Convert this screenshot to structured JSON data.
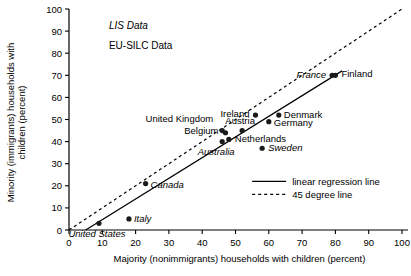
{
  "chart_data": {
    "type": "scatter",
    "title": "",
    "xlabel": "Majority (nonimmigrants) households with children (percent)",
    "ylabel": "Minority (immigrants) households with children (percent)",
    "xlim": [
      0,
      100
    ],
    "ylim": [
      0,
      100
    ],
    "xticks": [
      "0",
      "10",
      "20",
      "30",
      "40",
      "50",
      "60",
      "70",
      "80",
      "90",
      "100"
    ],
    "yticks": [
      "0",
      "10",
      "20",
      "30",
      "40",
      "50",
      "60",
      "70",
      "80",
      "90",
      "100"
    ],
    "grid": false,
    "points": [
      {
        "label": "United States",
        "x": 9,
        "y": 3,
        "source": "LIS Data",
        "style": "italic",
        "label_dx": -2,
        "label_dy": 14,
        "anchor": "middle"
      },
      {
        "label": "Italy",
        "x": 18,
        "y": 5,
        "source": "LIS Data",
        "style": "italic",
        "label_dx": 5,
        "label_dy": 3,
        "anchor": "start"
      },
      {
        "label": "Canada",
        "x": 23,
        "y": 21,
        "source": "LIS Data",
        "style": "italic",
        "label_dx": 5,
        "label_dy": 4,
        "anchor": "start"
      },
      {
        "label": "Australia",
        "x": 46,
        "y": 40,
        "source": "LIS Data",
        "style": "italic",
        "label_dx": -6,
        "label_dy": 13,
        "anchor": "middle"
      },
      {
        "label": "United Kingdom",
        "x": 46,
        "y": 45,
        "source": "EU-SILC Data",
        "style": "roman",
        "label_dx": -9,
        "label_dy": -9,
        "anchor": "end"
      },
      {
        "label": "Belgium",
        "x": 47,
        "y": 44,
        "source": "EU-SILC Data",
        "style": "roman",
        "label_dx": -7,
        "label_dy": 1,
        "anchor": "end"
      },
      {
        "label": "Netherlands",
        "x": 48,
        "y": 41,
        "source": "EU-SILC Data",
        "style": "roman",
        "label_dx": 6,
        "label_dy": 3,
        "anchor": "start"
      },
      {
        "label": "Austria",
        "x": 52,
        "y": 45,
        "source": "EU-SILC Data",
        "style": "roman",
        "label_dx": -2,
        "label_dy": -7,
        "anchor": "middle"
      },
      {
        "label": "Sweden",
        "x": 58,
        "y": 37,
        "source": "LIS Data",
        "style": "italic",
        "label_dx": 6,
        "label_dy": 3,
        "anchor": "start"
      },
      {
        "label": "Ireland",
        "x": 56,
        "y": 52,
        "source": "EU-SILC Data",
        "style": "roman",
        "label_dx": -6,
        "label_dy": 2,
        "anchor": "end"
      },
      {
        "label": "Germany",
        "x": 60,
        "y": 49,
        "source": "EU-SILC Data",
        "style": "roman",
        "label_dx": 5,
        "label_dy": 4,
        "anchor": "start"
      },
      {
        "label": "Denmark",
        "x": 63,
        "y": 52,
        "source": "EU-SILC Data",
        "style": "roman",
        "label_dx": 5,
        "label_dy": 3,
        "anchor": "start"
      },
      {
        "label": "France",
        "x": 79,
        "y": 70,
        "source": "LIS Data",
        "style": "italic",
        "label_dx": -6,
        "label_dy": 3,
        "anchor": "end"
      },
      {
        "label": "Finland",
        "x": 80,
        "y": 70,
        "source": "EU-SILC Data",
        "style": "roman",
        "label_dx": 6,
        "label_dy": 2,
        "anchor": "start"
      }
    ],
    "lines": [
      {
        "name": "linear regression line",
        "style": "solid",
        "x0": 5,
        "y0": 0,
        "x1": 82,
        "y1": 72
      },
      {
        "name": "45 degree line",
        "style": "dashed",
        "x0": 0,
        "y0": 0,
        "x1": 100,
        "y1": 100
      }
    ],
    "annotations": [
      {
        "text": "LIS Data",
        "style": "italic",
        "x": 12,
        "y": 91
      },
      {
        "text": "EU-SILC Data",
        "style": "roman",
        "x": 12,
        "y": 82
      }
    ],
    "legend": {
      "position": "bottom-right",
      "entries": [
        {
          "label": "linear regression line",
          "style": "solid"
        },
        {
          "label": "45 degree line",
          "style": "dashed"
        }
      ]
    }
  }
}
